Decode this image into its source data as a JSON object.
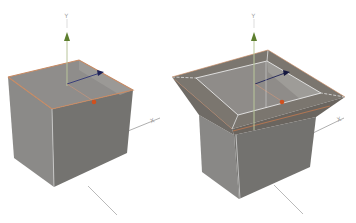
{
  "viewport": {
    "background": "#ffffff"
  },
  "colors": {
    "face_top": "#8e8b88",
    "face_left": "#8a8a88",
    "face_right": "#76746f",
    "rim_top": "#7a746c",
    "edge_highlight": "#c98a62",
    "inner_edge": "#e6e6e6",
    "y_axis": "#6a8a3a",
    "x_axis": "#2a2f6a",
    "z_axis": "#d0501e",
    "axis_line": "#a8a8a8"
  },
  "objects": [
    {
      "name": "box-open-top",
      "axes": {
        "y_label": "Y",
        "x_label": "X"
      }
    },
    {
      "name": "box-extruded-rim",
      "axes": {
        "y_label": "Y",
        "x_label": "X"
      }
    }
  ]
}
